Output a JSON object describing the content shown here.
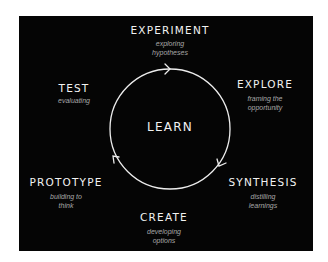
{
  "diagram": {
    "center": "LEARN",
    "colors": {
      "background": "#050505",
      "title": "#f2f2f2",
      "subtitle": "#a8a8a8",
      "circle": "#ededed"
    },
    "stages": [
      {
        "title": "EXPERIMENT",
        "subtitle": "exploring hypotheses",
        "sub_line1": "exploring",
        "sub_line2": "hypotheses"
      },
      {
        "title": "EXPLORE",
        "subtitle": "framing the opportunity",
        "sub_line1": "framing the",
        "sub_line2": "opportunity"
      },
      {
        "title": "SYNTHESIS",
        "subtitle": "distilling learnings",
        "sub_line1": "distilling",
        "sub_line2": "learnings"
      },
      {
        "title": "CREATE",
        "subtitle": "developing options",
        "sub_line1": "developing",
        "sub_line2": "options"
      },
      {
        "title": "PROTOTYPE",
        "subtitle": "building to think",
        "sub_line1": "building to",
        "sub_line2": "think"
      },
      {
        "title": "TEST",
        "subtitle": "evaluating",
        "sub_line1": "evaluating",
        "sub_line2": ""
      }
    ],
    "arrows": [
      "top-clockwise-right",
      "lower-right-clockwise-down",
      "lower-left-clockwise-up"
    ]
  }
}
